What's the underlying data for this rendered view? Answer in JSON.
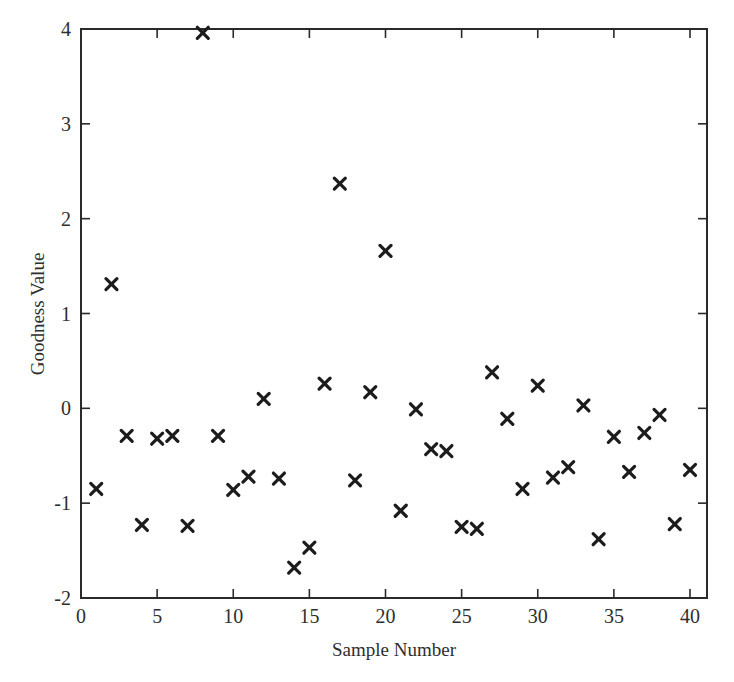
{
  "chart_data": {
    "type": "scatter",
    "title": "",
    "xlabel": "Sample Number",
    "ylabel": "Goodness Value",
    "xlim": [
      0,
      41
    ],
    "ylim": [
      -2,
      4
    ],
    "xticks": [
      0,
      5,
      10,
      15,
      20,
      25,
      30,
      35,
      40
    ],
    "xtick_labels": [
      "0",
      "5",
      "10",
      "15",
      "20",
      "25",
      "30",
      "35",
      "40"
    ],
    "yticks": [
      -2,
      -1,
      0,
      1,
      2,
      3,
      4
    ],
    "ytick_labels": [
      "-2",
      "-1",
      "0",
      "1",
      "2",
      "3",
      "4"
    ],
    "grid": false,
    "legend": null,
    "marker": "x",
    "marker_color": "#1c1c1c",
    "series": [
      {
        "name": "Goodness Value",
        "x": [
          1,
          2,
          3,
          4,
          5,
          6,
          7,
          8,
          9,
          10,
          11,
          12,
          13,
          14,
          15,
          16,
          17,
          18,
          19,
          20,
          21,
          22,
          23,
          24,
          25,
          26,
          27,
          28,
          29,
          30,
          31,
          32,
          33,
          34,
          35,
          36,
          37,
          38,
          39,
          40
        ],
        "y": [
          -0.85,
          1.31,
          -0.29,
          -1.23,
          -0.32,
          -0.29,
          -1.24,
          3.96,
          -0.29,
          -0.86,
          -0.72,
          0.1,
          -0.74,
          -1.68,
          -1.47,
          0.26,
          2.37,
          -0.76,
          0.17,
          1.66,
          -1.08,
          -0.01,
          -0.43,
          -0.45,
          -1.25,
          -1.27,
          0.38,
          -0.11,
          -0.85,
          0.24,
          -0.73,
          -0.62,
          0.03,
          -1.38,
          -0.3,
          -0.67,
          -0.26,
          -0.07,
          -1.22,
          -0.65
        ]
      }
    ]
  }
}
